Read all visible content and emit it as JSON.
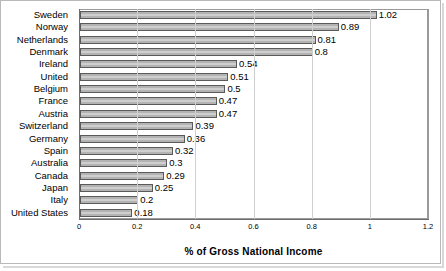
{
  "chart_data": {
    "type": "bar",
    "orientation": "horizontal",
    "title": "",
    "xlabel": "% of Gross National Income",
    "ylabel": "",
    "xlim": [
      0,
      1.2
    ],
    "xticks": [
      "0",
      "0.2",
      "0.4",
      "0.6",
      "0.8",
      "1",
      "1.2"
    ],
    "xtick_values": [
      0,
      0.2,
      0.4,
      0.6,
      0.8,
      1,
      1.2
    ],
    "grid": true,
    "legend": false,
    "categories": [
      "Sweden",
      "Norway",
      "Netherlands",
      "Denmark",
      "Ireland",
      "United",
      "Belgium",
      "France",
      "Austria",
      "Switzerland",
      "Germany",
      "Spain",
      "Australia",
      "Canada",
      "Japan",
      "Italy",
      "United States"
    ],
    "values": [
      1.02,
      0.89,
      0.81,
      0.8,
      0.54,
      0.51,
      0.5,
      0.47,
      0.47,
      0.39,
      0.36,
      0.32,
      0.3,
      0.29,
      0.25,
      0.2,
      0.18
    ],
    "value_labels": [
      "1.02",
      "0.89",
      "0.81",
      "0.8",
      "0.54",
      "0.51",
      "0.5",
      "0.47",
      "0.47",
      "0.39",
      "0.36",
      "0.32",
      "0.3",
      "0.29",
      "0.25",
      "0.2",
      "0.18"
    ],
    "bar_color": "#b3b3b3",
    "bar_border_color": "#5a5a5a",
    "grid_color": "#d0d0d0",
    "axis_color": "#6e6e6e"
  }
}
